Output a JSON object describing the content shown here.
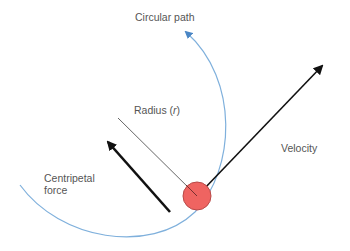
{
  "diagram": {
    "labels": {
      "circular_path": "Circular path",
      "radius_prefix": "Radius (",
      "radius_symbol": "r",
      "radius_suffix": ")",
      "velocity": "Velocity",
      "centripetal_line1": "Centripetal",
      "centripetal_line2": "force"
    },
    "colors": {
      "path": "#5b9bd5",
      "arrow": "#111111",
      "radius_line": "#555555",
      "object_fill": "#ef6461",
      "object_stroke": "#b84a48",
      "text": "#555555"
    },
    "object": {
      "cx": 197,
      "cy": 196,
      "r": 14
    }
  }
}
